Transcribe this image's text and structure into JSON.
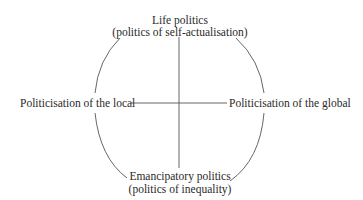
{
  "diagram": {
    "top": {
      "title": "Life politics",
      "subtitle": "(politics of self-actualisation)"
    },
    "bottom": {
      "title": "Emancipatory politics",
      "subtitle": "(politics of inequality)"
    },
    "left": {
      "title": "Politicisation of the local"
    },
    "right": {
      "title": "Politicisation of the global"
    },
    "colors": {
      "line": "#555555",
      "text": "#2a2a2a",
      "background": "#ffffff"
    }
  }
}
